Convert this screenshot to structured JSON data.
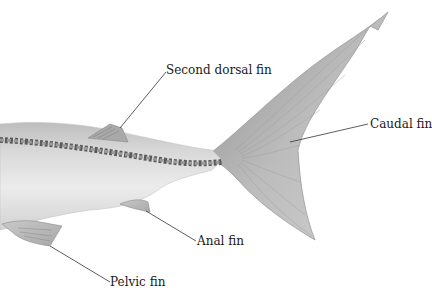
{
  "diagram": {
    "labels": [
      {
        "id": "second-dorsal-fin",
        "text": "Second dorsal fin"
      },
      {
        "id": "caudal-fin",
        "text": "Caudal fin"
      },
      {
        "id": "anal-fin",
        "text": "Anal fin"
      },
      {
        "id": "pelvic-fin",
        "text": "Pelvic fin"
      }
    ],
    "colors": {
      "body": "#d9d9d9",
      "body_shadow": "#bdbdbd",
      "vertebrae": "#6e6e6e",
      "fin": "#b5b5b5",
      "leader_line": "#333333"
    }
  }
}
